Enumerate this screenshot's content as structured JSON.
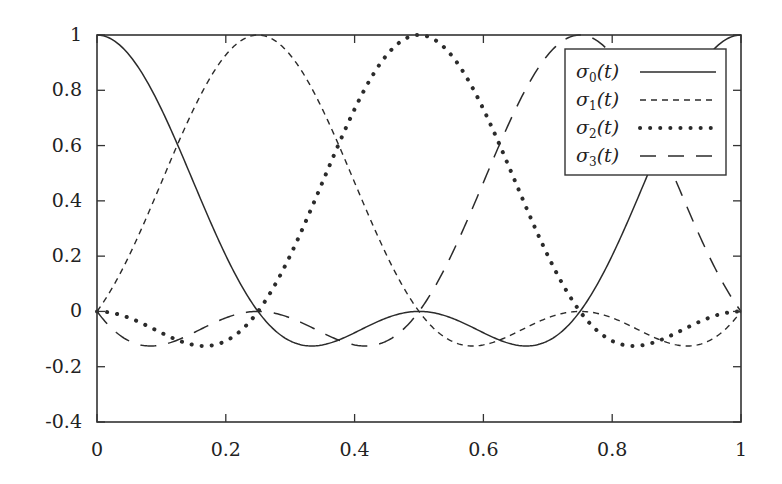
{
  "chart_data": {
    "type": "line",
    "title": "",
    "xlabel": "",
    "ylabel": "",
    "xlim": [
      0,
      1
    ],
    "ylim": [
      -0.4,
      1
    ],
    "grid": false,
    "legend_position": "top-right (inside)",
    "x_ticks": [
      "0",
      "0.2",
      "0.4",
      "0.6",
      "0.8",
      "1"
    ],
    "x_tick_values": [
      0,
      0.2,
      0.4,
      0.6,
      0.8,
      1
    ],
    "y_ticks": [
      "1",
      "0.8",
      "0.6",
      "0.4",
      "0.2",
      "0",
      "-0.2",
      "-0.4"
    ],
    "y_tick_values": [
      1,
      0.8,
      0.6,
      0.4,
      0.2,
      0,
      -0.2,
      -0.4
    ],
    "x": [
      0,
      0.0625,
      0.125,
      0.1875,
      0.25,
      0.3125,
      0.375,
      0.4375,
      0.5,
      0.5625,
      0.625,
      0.6875,
      0.75,
      0.8125,
      0.875,
      0.9375,
      1
    ],
    "series": [
      {
        "name": "σ0(t)",
        "label_base": "σ",
        "label_sub": "0",
        "label_arg": "(t)",
        "style": "solid",
        "shift": 0,
        "values": [
          1,
          0.915,
          0.677,
          0.353,
          0,
          -0.11,
          -0.073,
          0.018,
          0,
          0.018,
          -0.073,
          -0.11,
          0,
          0.353,
          0.677,
          0.915,
          1
        ]
      },
      {
        "name": "σ1(t)",
        "label_base": "σ",
        "label_sub": "1",
        "label_arg": "(t)",
        "style": "dashed",
        "shift": 0.25,
        "values": [
          0,
          0.353,
          0.677,
          0.915,
          1,
          0.915,
          0.677,
          0.353,
          0,
          -0.11,
          -0.073,
          0.018,
          0,
          0.018,
          -0.073,
          -0.11,
          0
        ]
      },
      {
        "name": "σ2(t)",
        "label_base": "σ",
        "label_sub": "2",
        "label_arg": "(t)",
        "style": "dotted",
        "shift": 0.5,
        "values": [
          0,
          0.018,
          -0.073,
          -0.11,
          0,
          0.353,
          0.677,
          0.915,
          1,
          0.915,
          0.677,
          0.353,
          0,
          -0.11,
          -0.073,
          0.018,
          0
        ]
      },
      {
        "name": "σ3(t)",
        "label_base": "σ",
        "label_sub": "3",
        "label_arg": "(t)",
        "style": "long-dashed",
        "shift": 0.75,
        "values": [
          0,
          -0.11,
          -0.073,
          0.018,
          0,
          0.018,
          -0.073,
          -0.11,
          0,
          0.353,
          0.677,
          0.915,
          1,
          0.915,
          0.677,
          0.353,
          0
        ]
      }
    ]
  }
}
